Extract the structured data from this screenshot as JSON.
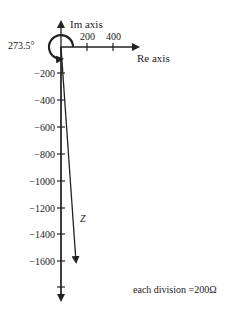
{
  "diagram": {
    "type": "phasor-diagram",
    "axes": {
      "real_label": "Re axis",
      "imag_label": "Im axis"
    },
    "real_ticks": [
      {
        "value": 200,
        "label": "200"
      },
      {
        "value": 400,
        "label": "400"
      }
    ],
    "imag_ticks": [
      {
        "value": -200,
        "label": "−200"
      },
      {
        "value": -400,
        "label": "−400"
      },
      {
        "value": -600,
        "label": "−600"
      },
      {
        "value": -800,
        "label": "−800"
      },
      {
        "value": -1000,
        "label": "−1000"
      },
      {
        "value": -1200,
        "label": "−1200"
      },
      {
        "value": -1400,
        "label": "−1400"
      },
      {
        "value": -1600,
        "label": "−1600"
      }
    ],
    "angle_label": "273.5°",
    "phasor_label": "𝔷",
    "phasor": {
      "angle_deg": 273.5,
      "real": 100,
      "imag": -1600
    },
    "scale_note": "each division =200Ω"
  }
}
